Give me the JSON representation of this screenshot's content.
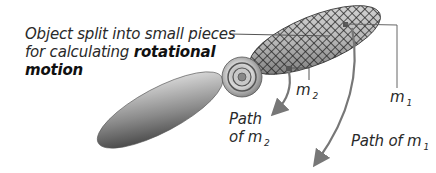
{
  "diagram": {
    "caption": {
      "line1": "Object split into small pieces",
      "line2_prefix": "for calculating ",
      "line2_bold": "rotational",
      "line3_bold": "motion"
    },
    "labels": {
      "m2": {
        "symbol": "m",
        "subscript": "2"
      },
      "m1": {
        "symbol": "m",
        "subscript": "1"
      },
      "path_m2": {
        "line1": "Path",
        "line2_prefix": "of ",
        "symbol": "m",
        "subscript": "2"
      },
      "path_m1": {
        "prefix": "Path of ",
        "symbol": "m",
        "subscript": "1"
      }
    },
    "components": [
      "gridded-blade",
      "plain-blade",
      "hub",
      "path-arrow-m1",
      "path-arrow-m2"
    ],
    "colors": {
      "line": "#777777",
      "text": "#2a2a2a",
      "blade_dark": "#3a3a3a",
      "blade_light": "#e6e6e6"
    }
  }
}
